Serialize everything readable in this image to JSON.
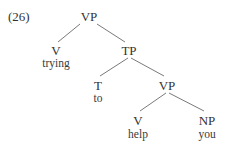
{
  "example": {
    "number": "(26)"
  },
  "tree": {
    "root": {
      "label": "VP"
    },
    "v1": {
      "label": "V",
      "word": "trying"
    },
    "tp": {
      "label": "TP"
    },
    "t": {
      "label": "T",
      "word": "to"
    },
    "vp2": {
      "label": "VP"
    },
    "v2": {
      "label": "V",
      "word": "help"
    },
    "np": {
      "label": "NP",
      "word": "you"
    }
  },
  "colors": {
    "text": "#333333",
    "edge": "#6a6a6a",
    "background": "#ffffff"
  }
}
